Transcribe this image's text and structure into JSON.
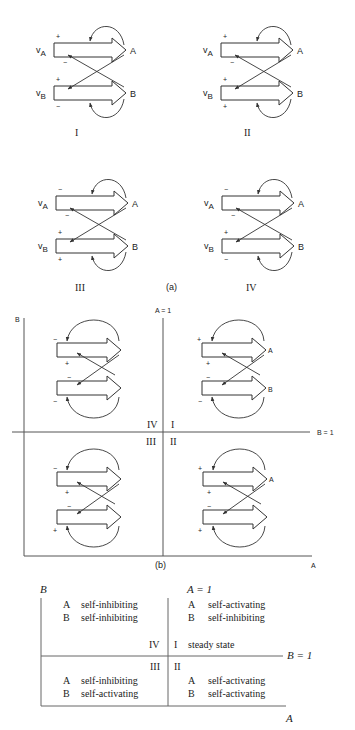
{
  "part_a": {
    "caption": "(a)",
    "panels": [
      {
        "id": "I",
        "label": "I",
        "vA": "v",
        "vA_sub": "A",
        "vB": "v",
        "vB_sub": "B",
        "signs": {
          "a_top": "+",
          "a_bottom": "−",
          "b_top": "+",
          "b_bottom": "−"
        },
        "node_a": "A",
        "node_b": "B"
      },
      {
        "id": "II",
        "label": "II",
        "vA": "v",
        "vA_sub": "A",
        "vB": "v",
        "vB_sub": "B",
        "signs": {
          "a_top": "+",
          "a_bottom": "−",
          "b_top": "+",
          "b_bottom": "+"
        },
        "node_a": "A",
        "node_b": "B"
      },
      {
        "id": "III",
        "label": "III",
        "vA": "v",
        "vA_sub": "A",
        "vB": "v",
        "vB_sub": "B",
        "signs": {
          "a_top": "−",
          "a_bottom": "−",
          "b_top": "+",
          "b_bottom": "+"
        },
        "node_a": "A",
        "node_b": "B"
      },
      {
        "id": "IV",
        "label": "IV",
        "vA": "v",
        "vA_sub": "A",
        "vB": "v",
        "vB_sub": "B",
        "signs": {
          "a_top": "−",
          "a_bottom": "−",
          "b_top": "+",
          "b_bottom": "−"
        },
        "node_a": "A",
        "node_b": "B"
      }
    ]
  },
  "part_b": {
    "caption": "(b)",
    "y_axis_label": "B",
    "x_axis_label": "A",
    "a_equals_1": "A = 1",
    "b_equals_1": "B = 1",
    "quadrants": {
      "q1": "I",
      "q2": "II",
      "q3": "III",
      "q4": "IV"
    },
    "node_a": "A",
    "node_b": "B",
    "panels": {
      "IV": {
        "a_top": "−",
        "a_bottom": "+",
        "b_top": "−",
        "b_bottom": "−"
      },
      "I": {
        "a_top": "+",
        "a_bottom": "+",
        "b_top": "−",
        "b_bottom": "−"
      },
      "III": {
        "a_top": "−",
        "a_bottom": "+",
        "b_top": "−",
        "b_bottom": "+"
      },
      "II": {
        "a_top": "+",
        "a_bottom": "+",
        "b_top": "−",
        "b_bottom": "+"
      }
    }
  },
  "table": {
    "y_axis_label": "B",
    "x_axis_label": "A",
    "a_equals_1": "A = 1",
    "b_equals_1": "B = 1",
    "quadrant_IV": {
      "label": "IV",
      "rows": [
        {
          "node": "A",
          "text": "self-inhibiting"
        },
        {
          "node": "B",
          "text": "self-inhibiting"
        }
      ]
    },
    "quadrant_I": {
      "label": "I",
      "note": "steady state",
      "rows": [
        {
          "node": "A",
          "text": "self-activating"
        },
        {
          "node": "B",
          "text": "self-inhibiting"
        }
      ]
    },
    "quadrant_III": {
      "label": "III",
      "rows": [
        {
          "node": "A",
          "text": "self-inhibiting"
        },
        {
          "node": "B",
          "text": "self-activating"
        }
      ]
    },
    "quadrant_II": {
      "label": "II",
      "rows": [
        {
          "node": "A",
          "text": "self-activating"
        },
        {
          "node": "B",
          "text": "self-activating"
        }
      ]
    }
  }
}
